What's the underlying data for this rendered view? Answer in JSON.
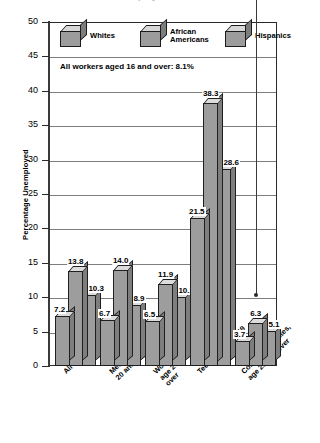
{
  "chart_data": {
    "type": "bar",
    "title": "Unemployment Rates",
    "subtitle": "",
    "xlabel": "",
    "ylabel": "Percentage Unemployed",
    "ylim": [
      0,
      50
    ],
    "ytick_step": 5,
    "yticks": [
      "50",
      "45",
      "40",
      "35",
      "30",
      "25",
      "20",
      "15",
      "10",
      "5",
      "0"
    ],
    "grid": true,
    "legend_position": "top-inside",
    "categories": [
      "All",
      "Men, age\n20 and over",
      "Women,\nage 20 and\nover",
      "Teens, ages 16–19",
      "College graduates,\nage 25 and over"
    ],
    "series": [
      {
        "name": "Whites",
        "values": [
          7.2,
          6.7,
          6.5,
          21.5,
          3.7
        ]
      },
      {
        "name": "African\nAmericans",
        "values": [
          13.8,
          14.0,
          11.9,
          38.3,
          6.3
        ]
      },
      {
        "name": "Hispanics",
        "values": [
          10.3,
          8.9,
          10.1,
          28.6,
          5.1
        ]
      }
    ],
    "value_labels": [
      [
        "7.2",
        "13.8",
        "10.3"
      ],
      [
        "6.7",
        "14.0",
        "8.9"
      ],
      [
        "6.5",
        "11.9",
        "10.1"
      ],
      [
        "21.5",
        "38.3",
        "28.6"
      ],
      [
        "3.7",
        "6.3",
        "5.1"
      ]
    ],
    "annotation": "All workers aged 16 and over: 8.1%",
    "colors": {
      "bar_front": "#9d9d9d",
      "bar_top": "#dcdcdc",
      "bar_side": "#7e7e7e",
      "outline": "#1f1f1f",
      "grid": "#7d7d7d",
      "axis": "#2a2a2a",
      "background": "#ffffff"
    }
  },
  "legend": {
    "items": [
      {
        "label": "Whites"
      },
      {
        "label": "African\nAmericans"
      },
      {
        "label": "Hispanics"
      }
    ]
  }
}
